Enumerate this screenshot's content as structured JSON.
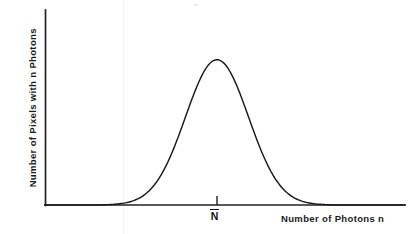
{
  "figure": {
    "background_color": "#ffffff",
    "ink_color": "#1a1a1a"
  },
  "axes": {
    "y_label": "Number of Pixels with n Photons",
    "x_label": "Number of Photons n",
    "origin_x": 45,
    "origin_y": 205,
    "y_top": 10,
    "x_right": 405,
    "line_color": "#222222",
    "line_width": 1.6
  },
  "annotations": {
    "mean_marker": {
      "glyph": "N",
      "has_overbar": true,
      "x": 217,
      "tick_top": 196,
      "tick_bottom": 205
    }
  },
  "chart_data": {
    "type": "line",
    "title": "",
    "xlabel": "Number of Photons n",
    "ylabel": "Number of Pixels with n Photons",
    "curve_name": "Poisson / Gaussian photon count distribution",
    "grid": false,
    "legend": false,
    "xlim": [
      0,
      1
    ],
    "ylim": [
      0,
      1
    ],
    "xticks": [
      "N̅"
    ],
    "yticks": [],
    "peak": {
      "x": 0.4778,
      "y": 1.0
    },
    "mean_normalized": 0.4778,
    "sigma_normalized": 0.0875,
    "x": [
      0.0,
      0.05,
      0.1,
      0.15,
      0.2,
      0.225,
      0.25,
      0.275,
      0.3,
      0.325,
      0.35,
      0.375,
      0.4,
      0.425,
      0.45,
      0.478,
      0.5,
      0.525,
      0.55,
      0.575,
      0.6,
      0.625,
      0.65,
      0.675,
      0.7,
      0.75,
      0.8,
      0.85,
      0.9,
      1.0
    ],
    "y": [
      0.0,
      0.0,
      0.0,
      0.001,
      0.005,
      0.013,
      0.027,
      0.052,
      0.093,
      0.154,
      0.235,
      0.337,
      0.452,
      0.573,
      0.7,
      1.0,
      0.974,
      0.915,
      0.806,
      0.676,
      0.54,
      0.412,
      0.298,
      0.204,
      0.132,
      0.046,
      0.012,
      0.002,
      0.0,
      0.0
    ]
  }
}
